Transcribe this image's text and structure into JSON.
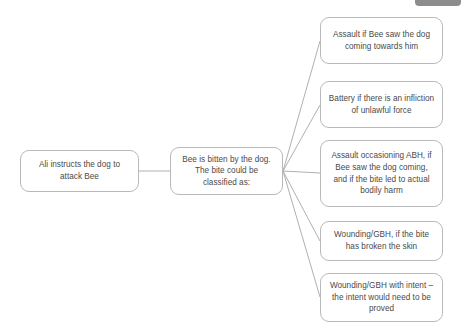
{
  "diagram": {
    "type": "flowchart",
    "orientation": "left-to-right",
    "background_color": "#ffffff",
    "node_border_color": "#b9b9b9",
    "node_fill_color": "#ffffff",
    "text_color": "#4a4a4a",
    "edge_color": "#b0b0b0",
    "nodes": [
      {
        "id": "cause",
        "label": "Ali instructs the dog to attack Bee",
        "x": 20,
        "y": 150,
        "w": 119,
        "h": 42
      },
      {
        "id": "event",
        "label": "Bee is bitten by the dog. The bite could be classified as:",
        "x": 170,
        "y": 147,
        "w": 113,
        "h": 48
      },
      {
        "id": "outcome-assault",
        "label": "Assault if Bee saw the dog coming towards him",
        "x": 320,
        "y": 17,
        "w": 123,
        "h": 47
      },
      {
        "id": "outcome-battery",
        "label": "Battery if there is an infliction of unlawful force",
        "x": 320,
        "y": 81,
        "w": 123,
        "h": 47
      },
      {
        "id": "outcome-abh",
        "label": "Assault occasioning ABH, if Bee saw the dog coming, and if the bite led to actual bodily harm",
        "x": 320,
        "y": 140,
        "w": 123,
        "h": 67
      },
      {
        "id": "outcome-gbh",
        "label": "Wounding/GBH, if the bite has broken the skin",
        "x": 320,
        "y": 221,
        "w": 123,
        "h": 40
      },
      {
        "id": "outcome-gbh-intent",
        "label": "Wounding/GBH with intent – the intent would need to be proved",
        "x": 320,
        "y": 273,
        "w": 123,
        "h": 49
      }
    ],
    "edges": [
      {
        "from": "cause",
        "to": "event",
        "x1": 139,
        "y1": 171,
        "x2": 170,
        "y2": 171
      },
      {
        "from": "event",
        "to": "outcome-assault",
        "x1": 283,
        "y1": 171,
        "x2": 320,
        "y2": 41
      },
      {
        "from": "event",
        "to": "outcome-battery",
        "x1": 283,
        "y1": 171,
        "x2": 320,
        "y2": 105
      },
      {
        "from": "event",
        "to": "outcome-abh",
        "x1": 283,
        "y1": 171,
        "x2": 320,
        "y2": 173
      },
      {
        "from": "event",
        "to": "outcome-gbh",
        "x1": 283,
        "y1": 171,
        "x2": 320,
        "y2": 241
      },
      {
        "from": "event",
        "to": "outcome-gbh-intent",
        "x1": 283,
        "y1": 171,
        "x2": 320,
        "y2": 297
      }
    ]
  },
  "chrome": {
    "top_bar": {
      "name": "partial-toolbar-bar",
      "x": 415,
      "y": 0,
      "w": 46,
      "h": 6,
      "color": "#8d8d8d"
    }
  }
}
